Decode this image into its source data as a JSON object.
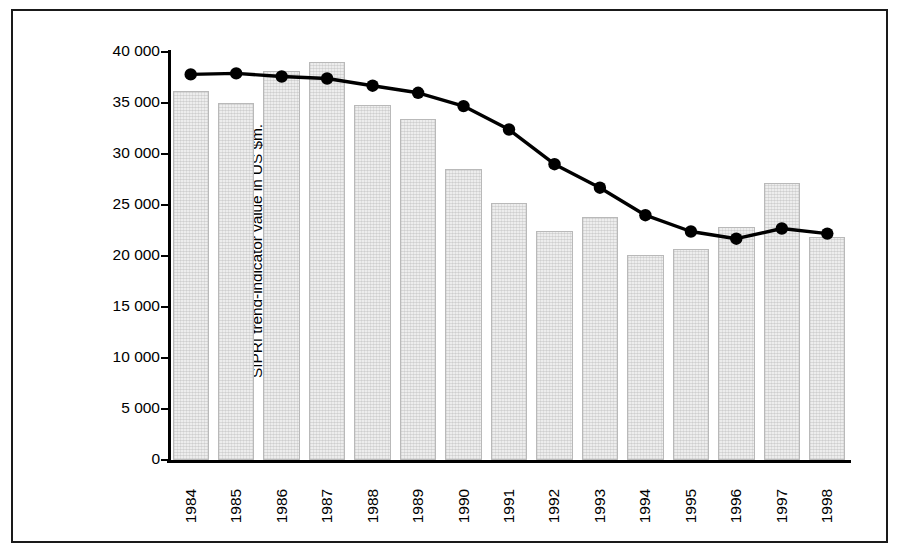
{
  "chart_data": {
    "type": "bar",
    "title": "",
    "subtitle": "",
    "xlabel": "",
    "ylabel_line1": "SIPRI trend-indicator value in US $m.",
    "ylabel_line2": "at constant (1990) prices",
    "categories": [
      "1984",
      "1985",
      "1986",
      "1987",
      "1988",
      "1989",
      "1990",
      "1991",
      "1992",
      "1993",
      "1994",
      "1995",
      "1996",
      "1997",
      "1998"
    ],
    "ylim": [
      0,
      40000
    ],
    "ytick_values": [
      0,
      5000,
      10000,
      15000,
      20000,
      25000,
      30000,
      35000,
      40000
    ],
    "ytick_labels": [
      "0",
      "5 000",
      "10 000",
      "15 000",
      "20 000",
      "25 000",
      "30 000",
      "35 000",
      "40 000"
    ],
    "grid": false,
    "legend": "none",
    "series": [
      {
        "name": "Annual value",
        "type": "bar",
        "values": [
          36200,
          35000,
          38100,
          39000,
          34800,
          33400,
          28500,
          25200,
          22500,
          23800,
          20100,
          20700,
          22800,
          27200,
          21900
        ]
      },
      {
        "name": "Trend",
        "type": "line",
        "marker": "circle",
        "color": "#000000",
        "values": [
          37800,
          37900,
          37600,
          37400,
          36700,
          36000,
          34700,
          32400,
          29000,
          26700,
          24000,
          22400,
          21700,
          22700,
          22200
        ]
      }
    ]
  },
  "style": {
    "bar_fill": "#ededed",
    "bar_stroke": "#b9b9b9",
    "line_color": "#000000",
    "axis_color": "#000000",
    "frame_color": "#1a1a1a",
    "background": "#ffffff"
  }
}
